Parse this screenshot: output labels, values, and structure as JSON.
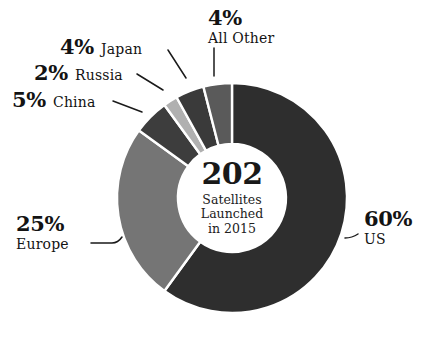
{
  "chart_data": {
    "type": "pie",
    "variant": "donut",
    "title": "",
    "subtitle": "",
    "categories": [
      "US",
      "Europe",
      "China",
      "Russia",
      "Japan",
      "All Other"
    ],
    "values": [
      60,
      25,
      5,
      2,
      4,
      4
    ],
    "value_unit": "%",
    "total": 202,
    "total_label_lines": [
      "Satellites",
      "Launched",
      "in 2015"
    ],
    "legend": "none",
    "grid": false,
    "start_angle_deg": 0,
    "direction": "clockwise",
    "slices": [
      {
        "name": "US",
        "percent": 60,
        "pct_text": "60%",
        "color": "#2e2e2e"
      },
      {
        "name": "Europe",
        "percent": 25,
        "pct_text": "25%",
        "color": "#757575"
      },
      {
        "name": "China",
        "percent": 5,
        "pct_text": "5%",
        "color": "#3d3d3d"
      },
      {
        "name": "Russia",
        "percent": 2,
        "pct_text": "2%",
        "color": "#b0b0b0"
      },
      {
        "name": "Japan",
        "percent": 4,
        "pct_text": "4%",
        "color": "#3a3a3a"
      },
      {
        "name": "All Other",
        "percent": 4,
        "pct_text": "4%",
        "color": "#5a5a5a"
      }
    ]
  },
  "center": {
    "total": "202",
    "line1": "Satellites",
    "line2": "Launched",
    "line3": "in 2015"
  },
  "callouts": {
    "japan": {
      "pct": "4%",
      "name": "Japan"
    },
    "russia": {
      "pct": "2%",
      "name": "Russia"
    },
    "china": {
      "pct": "5%",
      "name": "China"
    },
    "all_other": {
      "pct": "4%",
      "name": "All Other"
    },
    "us": {
      "pct": "60%",
      "name": "US"
    },
    "europe": {
      "pct": "25%",
      "name": "Europe"
    }
  },
  "colors": {
    "background": "#ffffff",
    "text": "#131313",
    "separator": "#ffffff",
    "leader_line": "#1a1a1a"
  }
}
